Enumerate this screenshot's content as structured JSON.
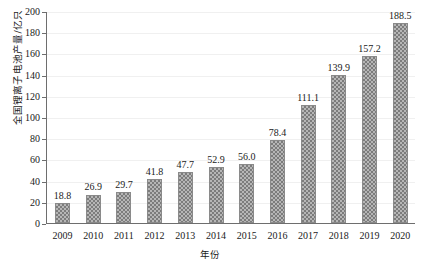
{
  "chart_data": {
    "type": "bar",
    "title": "",
    "xlabel": "年份",
    "ylabel": "全国锂离子电池产量/亿只",
    "categories": [
      "2009",
      "2010",
      "2011",
      "2012",
      "2013",
      "2014",
      "2015",
      "2016",
      "2017",
      "2018",
      "2019",
      "2020"
    ],
    "values": [
      18.8,
      26.9,
      29.7,
      41.8,
      47.7,
      52.9,
      56.0,
      78.4,
      111.1,
      139.9,
      157.2,
      188.5
    ],
    "value_labels": [
      "18.8",
      "26.9",
      "29.7",
      "41.8",
      "47.7",
      "52.9",
      "56.0",
      "78.4",
      "111.1",
      "139.9",
      "157.2",
      "188.5"
    ],
    "ylim": [
      0,
      200
    ],
    "ytick_values": [
      0,
      20,
      40,
      60,
      80,
      100,
      120,
      140,
      160,
      180,
      200
    ],
    "ytick_labels": [
      "0",
      "20",
      "40",
      "60",
      "80",
      "100",
      "120",
      "140",
      "160",
      "180",
      "200"
    ],
    "grid": true,
    "grid_axis": "y",
    "legend": false,
    "bar_color": "#b6b6b6",
    "bar_pattern": "checkerboard",
    "bar_edge_color": "#8a8a8a",
    "grid_color": "#f0f0f0",
    "axis_color": "#6e6e6e"
  }
}
